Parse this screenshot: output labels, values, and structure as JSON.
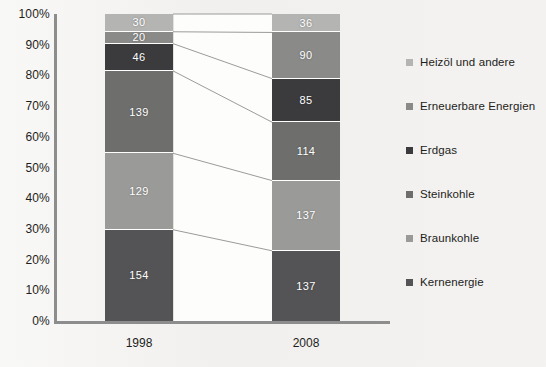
{
  "chart_data": {
    "type": "bar",
    "subtype": "stacked-100-percent",
    "title": "",
    "xlabel": "",
    "ylabel": "",
    "categories": [
      "1998",
      "2008"
    ],
    "ylim": [
      0,
      100
    ],
    "ytick_labels": [
      "100%",
      "90%",
      "80%",
      "70%",
      "60%",
      "50%",
      "40%",
      "30%",
      "20%",
      "10%",
      "0%"
    ],
    "ytick_values": [
      100,
      90,
      80,
      70,
      60,
      50,
      40,
      30,
      20,
      10,
      0
    ],
    "grid": false,
    "legend_position": "right",
    "value_labels_shown": true,
    "totals": [
      518,
      599
    ],
    "series": [
      {
        "name": "Heizöl und andere",
        "color": "#b4b4b2",
        "values": [
          30,
          36
        ],
        "stack_order_from_top": 1
      },
      {
        "name": "Erneuerbare Energien",
        "color": "#8a8a88",
        "values": [
          20,
          90
        ],
        "stack_order_from_top": 2
      },
      {
        "name": "Erdgas",
        "color": "#3b3b3d",
        "values": [
          46,
          85
        ],
        "stack_order_from_top": 3
      },
      {
        "name": "Steinkohle",
        "color": "#6e6e6d",
        "values": [
          139,
          114
        ],
        "stack_order_from_top": 4
      },
      {
        "name": "Braunkohle",
        "color": "#9a9a98",
        "values": [
          129,
          137
        ],
        "stack_order_from_top": 5
      },
      {
        "name": "Kernenergie",
        "color": "#545456",
        "values": [
          154,
          137
        ],
        "stack_order_from_top": 6
      }
    ]
  },
  "axis": {
    "axis_color": "#8d8d8d"
  },
  "legend": {
    "items": [
      {
        "label": "Heizöl und andere",
        "color": "#b4b4b2"
      },
      {
        "label": "Erneuerbare Energien",
        "color": "#8a8a88"
      },
      {
        "label": "Erdgas",
        "color": "#3b3b3d"
      },
      {
        "label": "Steinkohle",
        "color": "#6e6e6d"
      },
      {
        "label": "Braunkohle",
        "color": "#9a9a98"
      },
      {
        "label": "Kernenergie",
        "color": "#545456"
      }
    ]
  }
}
